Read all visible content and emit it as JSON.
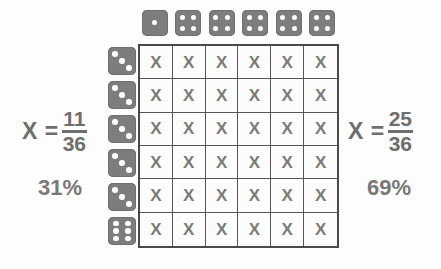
{
  "diagram": {
    "background_color": "#fdfdfd",
    "die_color": "#7d7d7d",
    "pip_color": "#fdfdfd",
    "mark_color": "#7b7b7b",
    "text_color": "#6e6e6e",
    "grid_line_color": "#555555"
  },
  "column_dice": [
    {
      "name": "column-die-1",
      "pips": 1
    },
    {
      "name": "column-die-2",
      "pips": 4
    },
    {
      "name": "column-die-3",
      "pips": 4
    },
    {
      "name": "column-die-4",
      "pips": 4
    },
    {
      "name": "column-die-5",
      "pips": 4
    },
    {
      "name": "column-die-6",
      "pips": 4
    }
  ],
  "row_dice": [
    {
      "name": "row-die-1",
      "pips": 3
    },
    {
      "name": "row-die-2",
      "pips": 3
    },
    {
      "name": "row-die-3",
      "pips": 3
    },
    {
      "name": "row-die-4",
      "pips": 3
    },
    {
      "name": "row-die-5",
      "pips": 3
    },
    {
      "name": "row-die-6",
      "pips": 6
    }
  ],
  "grid": {
    "rows": 6,
    "columns": 6,
    "total_cells": 36,
    "cell_mark": "X",
    "cells": [
      [
        "X",
        "X",
        "X",
        "X",
        "X",
        "X"
      ],
      [
        "X",
        "X",
        "X",
        "X",
        "X",
        "X"
      ],
      [
        "X",
        "X",
        "X",
        "X",
        "X",
        "X"
      ],
      [
        "X",
        "X",
        "X",
        "X",
        "X",
        "X"
      ],
      [
        "X",
        "X",
        "X",
        "X",
        "X",
        "X"
      ],
      [
        "X",
        "X",
        "X",
        "X",
        "X",
        "X"
      ]
    ]
  },
  "left_label": {
    "variable": "X =",
    "numerator": "11",
    "denominator": "36",
    "percent": "31%"
  },
  "right_label": {
    "variable": "X =",
    "numerator": "25",
    "denominator": "36",
    "percent": "69%"
  }
}
